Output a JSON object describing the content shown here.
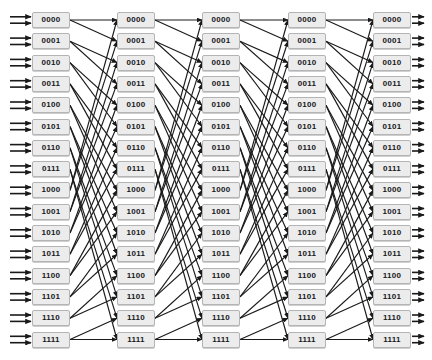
{
  "diagram": {
    "type": "interconnection-network",
    "stage_count": 5,
    "node_count_per_stage": 16,
    "degree_in": 2,
    "degree_out": 2,
    "node_labels": [
      "0000",
      "0001",
      "0010",
      "0011",
      "0100",
      "0101",
      "0110",
      "0111",
      "1000",
      "1001",
      "1010",
      "1011",
      "1100",
      "1101",
      "1110",
      "1111"
    ],
    "connection_rule": "perfect-shuffle: node b3b2b1b0 in stage k connects to nodes b2b1b0 0 and b2b1b0 1 in stage k+1",
    "colors": {
      "background": "#ffffff",
      "node_fill": "#ececec",
      "node_border": "#b4b4b4",
      "node_text": "#16181a",
      "edge": "#1a1a1a"
    },
    "geometry": {
      "width": 432,
      "height": 360,
      "node_width": 38,
      "node_height": 16,
      "row_pitch": 21.3,
      "first_row_top": 12,
      "stage_x": [
        32,
        117,
        202,
        288,
        373
      ],
      "input_arrow_x_start": 10,
      "output_arrow_x_end": 424
    },
    "edges": [
      {
        "from": 0,
        "to": 0
      },
      {
        "from": 0,
        "to": 1
      },
      {
        "from": 1,
        "to": 2
      },
      {
        "from": 1,
        "to": 3
      },
      {
        "from": 2,
        "to": 4
      },
      {
        "from": 2,
        "to": 5
      },
      {
        "from": 3,
        "to": 6
      },
      {
        "from": 3,
        "to": 7
      },
      {
        "from": 4,
        "to": 8
      },
      {
        "from": 4,
        "to": 9
      },
      {
        "from": 5,
        "to": 10
      },
      {
        "from": 5,
        "to": 11
      },
      {
        "from": 6,
        "to": 12
      },
      {
        "from": 6,
        "to": 13
      },
      {
        "from": 7,
        "to": 14
      },
      {
        "from": 7,
        "to": 15
      },
      {
        "from": 8,
        "to": 0
      },
      {
        "from": 8,
        "to": 1
      },
      {
        "from": 9,
        "to": 2
      },
      {
        "from": 9,
        "to": 3
      },
      {
        "from": 10,
        "to": 4
      },
      {
        "from": 10,
        "to": 5
      },
      {
        "from": 11,
        "to": 6
      },
      {
        "from": 11,
        "to": 7
      },
      {
        "from": 12,
        "to": 8
      },
      {
        "from": 12,
        "to": 9
      },
      {
        "from": 13,
        "to": 10
      },
      {
        "from": 13,
        "to": 11
      },
      {
        "from": 14,
        "to": 12
      },
      {
        "from": 14,
        "to": 13
      },
      {
        "from": 15,
        "to": 14
      },
      {
        "from": 15,
        "to": 15
      }
    ]
  }
}
